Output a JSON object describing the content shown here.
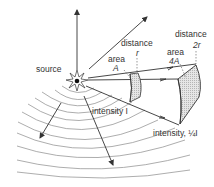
{
  "labels": {
    "source": "source",
    "distance_r": "distance",
    "r": "r",
    "distance_2r": "distance",
    "two_r": "2r",
    "area_a": "area",
    "a": "A",
    "area_4a": "area",
    "four_a": "4A",
    "intensity_i": "intensity I",
    "intensity_quarter": "intensity, ¼I"
  },
  "colors": {
    "line": "#333333",
    "wave": "#8a8a8a",
    "patch_fill": "#d8d8d8"
  }
}
